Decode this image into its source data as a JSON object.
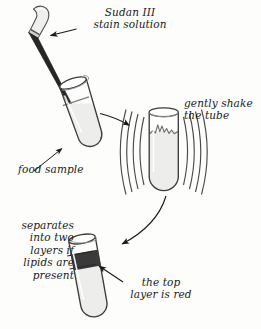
{
  "figure": {
    "background_color": "#fdfdfb",
    "ink_color": "#1a1a1a",
    "labels": {
      "sudan_stain": "Sudan III\nstain solution",
      "gently_shake": "gently shake\nthe tube",
      "food_sample": "food sample",
      "separates": "separates\ninto two\nlayers if\nlipids are\npresent",
      "top_layer_red": "the top\nlayer is red"
    },
    "steps": [
      {
        "id": "step-1-add-stain",
        "name": "tilted test tube with dropper",
        "label_refs": [
          "sudan_stain",
          "food_sample"
        ],
        "tube_orientation": "tilted",
        "liquid_color": "#eeeeec",
        "dropper_bulb_color": "#efefed",
        "dropper_stem_color": "#2b2b2b"
      },
      {
        "id": "step-2-shake",
        "name": "upright test tube being shaken",
        "label_refs": [
          "gently_shake"
        ],
        "tube_orientation": "upright",
        "liquid_color": "#ededeb",
        "motion_lines_per_side": 4
      },
      {
        "id": "step-3-layers",
        "name": "test tube with separated layers",
        "label_refs": [
          "separates",
          "top_layer_red"
        ],
        "tube_orientation": "tilted",
        "lower_layer_color": "#ededeb",
        "top_layer_color": "#3a3a3a",
        "top_layer_meaning": "red"
      }
    ],
    "flow_arrows": [
      {
        "id": "arrow-step1-to-step2",
        "from": "step-1-add-stain",
        "to": "step-2-shake",
        "direction": "right"
      },
      {
        "id": "arrow-step2-to-step3",
        "from": "step-2-shake",
        "to": "step-3-layers",
        "direction": "down-left"
      }
    ],
    "pointer_arrows": [
      {
        "id": "pointer-sudan-stain",
        "label_ref": "sudan_stain",
        "target": "dropper stem"
      },
      {
        "id": "pointer-food-sample",
        "label_ref": "food_sample",
        "target": "tube liquid"
      },
      {
        "id": "pointer-top-layer",
        "label_ref": "top_layer_red",
        "target": "dark upper layer"
      }
    ]
  }
}
